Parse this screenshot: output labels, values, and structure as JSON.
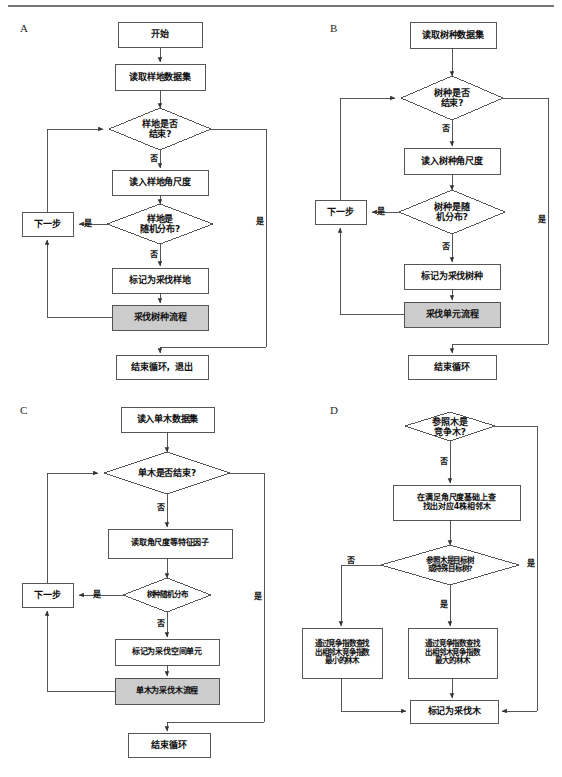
{
  "figure": {
    "type": "flowchart",
    "panels": [
      {
        "id": "A",
        "letter": "A",
        "nodes": [
          {
            "key": "a_start",
            "shape": "rect",
            "label": "开始"
          },
          {
            "key": "a_read",
            "shape": "rect",
            "label": "读取样地数据集"
          },
          {
            "key": "a_dec1",
            "shape": "diamond",
            "label": "样地是否\n结束?"
          },
          {
            "key": "a_readangle",
            "shape": "rect",
            "label": "读入样地角尺度"
          },
          {
            "key": "a_dec2",
            "shape": "diamond",
            "label": "样地是\n随机分布?"
          },
          {
            "key": "a_next",
            "shape": "rect",
            "label": "下一步"
          },
          {
            "key": "a_mark",
            "shape": "rect",
            "label": "标记为采伐样地"
          },
          {
            "key": "a_proc",
            "shape": "rect-shaded",
            "label": "采伐树种流程"
          },
          {
            "key": "a_end",
            "shape": "rect",
            "label": "结束循环，退出"
          }
        ],
        "edge_labels": [
          {
            "key": "a_l1",
            "text": "否"
          },
          {
            "key": "a_l2",
            "text": "是"
          },
          {
            "key": "a_l3",
            "text": "否"
          },
          {
            "key": "a_l4",
            "text": "是"
          }
        ]
      },
      {
        "id": "B",
        "letter": "B",
        "nodes": [
          {
            "key": "b_read",
            "shape": "rect",
            "label": "读取树种数据集"
          },
          {
            "key": "b_dec1",
            "shape": "diamond",
            "label": "树种是否\n结束?"
          },
          {
            "key": "b_readangle",
            "shape": "rect",
            "label": "读入树种角尺度"
          },
          {
            "key": "b_dec2",
            "shape": "diamond",
            "label": "树种是随\n机分布?"
          },
          {
            "key": "b_next",
            "shape": "rect",
            "label": "下一步"
          },
          {
            "key": "b_mark",
            "shape": "rect",
            "label": "标记为采伐树种"
          },
          {
            "key": "b_proc",
            "shape": "rect-shaded",
            "label": "采伐单元流程"
          },
          {
            "key": "b_end",
            "shape": "rect",
            "label": "结束循环"
          }
        ],
        "edge_labels": [
          {
            "key": "b_l1",
            "text": "否"
          },
          {
            "key": "b_l2",
            "text": "是"
          },
          {
            "key": "b_l3",
            "text": "否"
          },
          {
            "key": "b_l4",
            "text": "是"
          }
        ]
      },
      {
        "id": "C",
        "letter": "C",
        "nodes": [
          {
            "key": "c_read",
            "shape": "rect",
            "label": "读入单木数据集"
          },
          {
            "key": "c_dec1",
            "shape": "diamond",
            "label": "单木是否结束?"
          },
          {
            "key": "c_readfactor",
            "shape": "rect",
            "label": "读取角尺度等特征因子"
          },
          {
            "key": "c_dec2",
            "shape": "diamond",
            "label": "树种随机分布"
          },
          {
            "key": "c_next",
            "shape": "rect",
            "label": "下一步"
          },
          {
            "key": "c_mark",
            "shape": "rect",
            "label": "标记为采伐空间单元"
          },
          {
            "key": "c_proc",
            "shape": "rect-shaded",
            "label": "单木为采伐木流程"
          },
          {
            "key": "c_end",
            "shape": "rect",
            "label": "结束循环"
          }
        ],
        "edge_labels": [
          {
            "key": "c_l1",
            "text": "否"
          },
          {
            "key": "c_l2",
            "text": "是"
          },
          {
            "key": "c_l3",
            "text": "否"
          },
          {
            "key": "c_l4",
            "text": "是"
          }
        ]
      },
      {
        "id": "D",
        "letter": "D",
        "nodes": [
          {
            "key": "d_dec1",
            "shape": "diamond",
            "label": "参照木是\n竞争木?"
          },
          {
            "key": "d_find",
            "shape": "rect",
            "label": "在满足角尺度基础上查\n找出对应4株相邻木"
          },
          {
            "key": "d_dec2",
            "shape": "diamond",
            "label": "参照木是目标树\n或特殊目标树?"
          },
          {
            "key": "d_min",
            "shape": "rect",
            "label": "通过竞争指数查找\n出相邻木竞争指数\n最小的林木"
          },
          {
            "key": "d_max",
            "shape": "rect",
            "label": "通过竞争指数查找\n出相邻木竞争指数\n最大的林木"
          },
          {
            "key": "d_mark",
            "shape": "rect",
            "label": "标记为采伐木"
          }
        ],
        "edge_labels": [
          {
            "key": "d_l1",
            "text": "否"
          },
          {
            "key": "d_l2",
            "text": "是"
          },
          {
            "key": "d_l3",
            "text": "否"
          },
          {
            "key": "d_l4",
            "text": "是"
          }
        ]
      }
    ],
    "colors": {
      "stroke": "#444444",
      "shaded_fill": "#cccccc",
      "box_fill": "#ffffff",
      "text": "#101010",
      "rule": "#666666"
    }
  }
}
